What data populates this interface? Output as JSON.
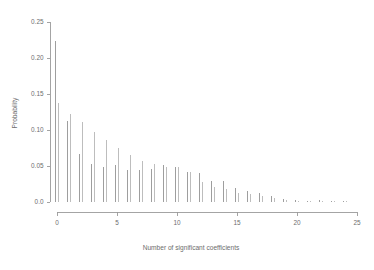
{
  "chart_data": {
    "type": "bar",
    "title": "",
    "xlabel": "Number of significant coefficients",
    "ylabel": "Probability",
    "xlim": [
      0,
      25
    ],
    "ylim": [
      0.0,
      0.25
    ],
    "grid": false,
    "legend": null,
    "x": [
      0,
      1,
      2,
      3,
      4,
      5,
      6,
      7,
      8,
      9,
      10,
      11,
      12,
      13,
      14,
      15,
      16,
      17,
      18,
      19,
      20,
      21,
      22,
      23,
      24
    ],
    "xticks": [
      0,
      5,
      10,
      15,
      20,
      25
    ],
    "xticklabels": [
      "0",
      "5",
      "10",
      "15",
      "20",
      "25"
    ],
    "yticks": [
      0.0,
      0.05,
      0.1,
      0.15,
      0.2,
      0.25
    ],
    "yticklabels": [
      "0.0",
      "0.05",
      "0.10",
      "0.15",
      "0.20",
      "0.25"
    ],
    "series": [
      {
        "name": "series-a",
        "color": "#8d8d8d",
        "values": [
          0.223,
          0.113,
          0.066,
          0.053,
          0.048,
          0.051,
          0.045,
          0.045,
          0.046,
          0.051,
          0.049,
          0.042,
          0.04,
          0.029,
          0.029,
          0.019,
          0.015,
          0.012,
          0.009,
          0.004,
          0.003,
          0.002,
          0.003,
          0.002,
          0.001
        ]
      },
      {
        "name": "series-b",
        "color": "#b2b2b2",
        "values": [
          0.138,
          0.122,
          0.111,
          0.097,
          0.086,
          0.075,
          0.065,
          0.057,
          0.053,
          0.049,
          0.048,
          0.041,
          0.028,
          0.021,
          0.018,
          0.013,
          0.011,
          0.008,
          0.005,
          0.003,
          0.002,
          0.002,
          0.002,
          0.001,
          0.001
        ]
      }
    ]
  }
}
